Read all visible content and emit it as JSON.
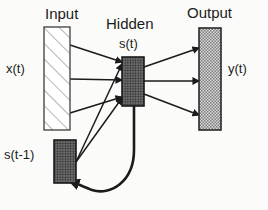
{
  "diagram": {
    "type": "neural-network-architecture",
    "labels": {
      "input_layer": "Input",
      "hidden_layer": "Hidden",
      "output_layer": "Output",
      "hidden_state": "s(t)",
      "input_signal": "x(t)",
      "output_signal": "y(t)",
      "context_state": "s(t-1)"
    },
    "colors": {
      "stroke": "#1b1b1b",
      "background": "#fbfbf9",
      "input_fill": "#ffffff",
      "input_hatch": "#8a8a8a",
      "hidden_fill": "#6e6e6e",
      "hidden_hatch": "#2b2b2b",
      "output_fill": "#c9c9c9",
      "output_hatch": "#7d7d7d",
      "context_fill": "#6e6e6e",
      "context_hatch": "#2b2b2b"
    },
    "nodes": [
      {
        "id": "input",
        "label": "Input",
        "x": 44,
        "y": 27,
        "w": 26,
        "h": 103,
        "pattern": "diagonal-hatch"
      },
      {
        "id": "hidden",
        "label": "Hidden",
        "x": 122,
        "y": 57,
        "w": 22,
        "h": 49,
        "pattern": "grid-hatch"
      },
      {
        "id": "output",
        "label": "Output",
        "x": 199,
        "y": 28,
        "w": 22,
        "h": 102,
        "pattern": "checker-hatch"
      },
      {
        "id": "context",
        "label": "s(t-1)",
        "x": 54,
        "y": 140,
        "w": 22,
        "h": 43,
        "pattern": "grid-hatch"
      }
    ],
    "connections": [
      {
        "from": "input",
        "to": "hidden",
        "kind": "arrow",
        "count": 3
      },
      {
        "from": "hidden",
        "to": "output",
        "kind": "arrow",
        "count": 3
      },
      {
        "from": "context",
        "to": "hidden",
        "kind": "line",
        "count": 2
      },
      {
        "from": "hidden",
        "to": "context",
        "kind": "curved-arrow",
        "count": 1
      }
    ]
  }
}
